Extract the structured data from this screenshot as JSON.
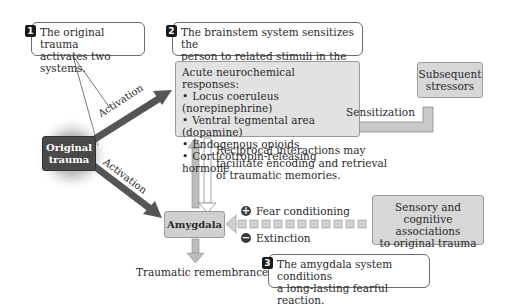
{
  "callouts": [
    {
      "number": "1",
      "text_lines": [
        "The original trauma",
        "activates two systems."
      ]
    },
    {
      "number": "2",
      "text_lines": [
        "The brainstem system sensitizes the",
        "person to related stimuli in the future."
      ]
    },
    {
      "number": "3",
      "text_lines": [
        "The amygdala system conditions",
        "a long-lasting fearful reaction."
      ]
    }
  ],
  "nodes": {
    "original_trauma": {
      "lines": [
        "Original",
        "trauma"
      ]
    },
    "acute_responses": {
      "title": "Acute neurochemical responses:",
      "items": [
        "Locus coeruleus (norepinephrine)",
        "Ventral tegmental area (dopamine)",
        "Endogenous opioids",
        "Corticotropin-releasing hormone"
      ]
    },
    "subsequent_stressors": {
      "lines": [
        "Subsequent",
        "stressors"
      ]
    },
    "amygdala": {
      "label": "Amygdala"
    },
    "sensory_associations": {
      "lines": [
        "Sensory and",
        "cognitive associations",
        "to original trauma"
      ]
    }
  },
  "edge_labels": {
    "activation_upper": "Activation",
    "activation_lower": "Activation",
    "sensitization": "Sensitization",
    "reciprocal": [
      "Reciprocal interactions may",
      "facilitate encoding and retrieval",
      "of traumatic memories."
    ],
    "fear_conditioning": "Fear conditioning",
    "extinction": "Extinction",
    "traumatic_remembrance": "Traumatic remembrance"
  },
  "symbols": {
    "plus": "+",
    "minus": "−"
  },
  "colors": {
    "dark_box": "#4a4a4a",
    "light_box": "#d7d7d7",
    "arrow_dark": "#555555",
    "arrow_light": "#c9c9c9"
  }
}
